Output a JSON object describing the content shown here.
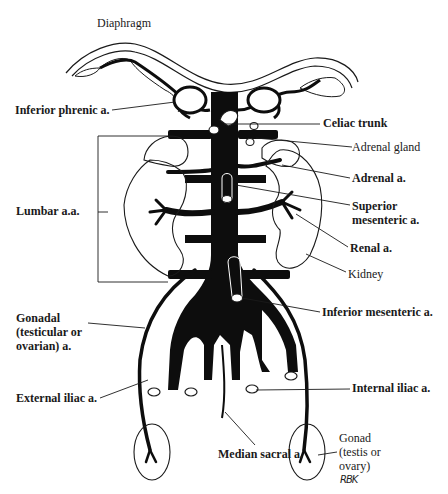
{
  "diagram": {
    "type": "anatomical-illustration",
    "signature": "RBK",
    "labels": {
      "diaphragm": "Diaphragm",
      "inferior_phrenic": "Inferior phrenic a.",
      "celiac_trunk": "Celiac trunk",
      "adrenal_gland": "Adrenal gland",
      "adrenal_a": "Adrenal a.",
      "lumbar": "Lumbar a.a.",
      "superior_mesenteric_1": "Superior",
      "superior_mesenteric_2": "mesenteric a.",
      "renal_a": "Renal a.",
      "kidney": "Kidney",
      "gonadal_1": "Gonadal",
      "gonadal_2": "(testicular or",
      "gonadal_3": "ovarian) a.",
      "inferior_mesenteric": "Inferior mesenteric a.",
      "external_iliac": "External iliac a.",
      "internal_iliac": "Internal iliac a.",
      "median_sacral": "Median sacral a.",
      "gonad_1": "Gonad",
      "gonad_2": "(testis or",
      "gonad_3": "ovary)"
    },
    "colors": {
      "vessel": "#0d0d0d",
      "outline": "#1a1a1a",
      "background": "#ffffff"
    }
  }
}
